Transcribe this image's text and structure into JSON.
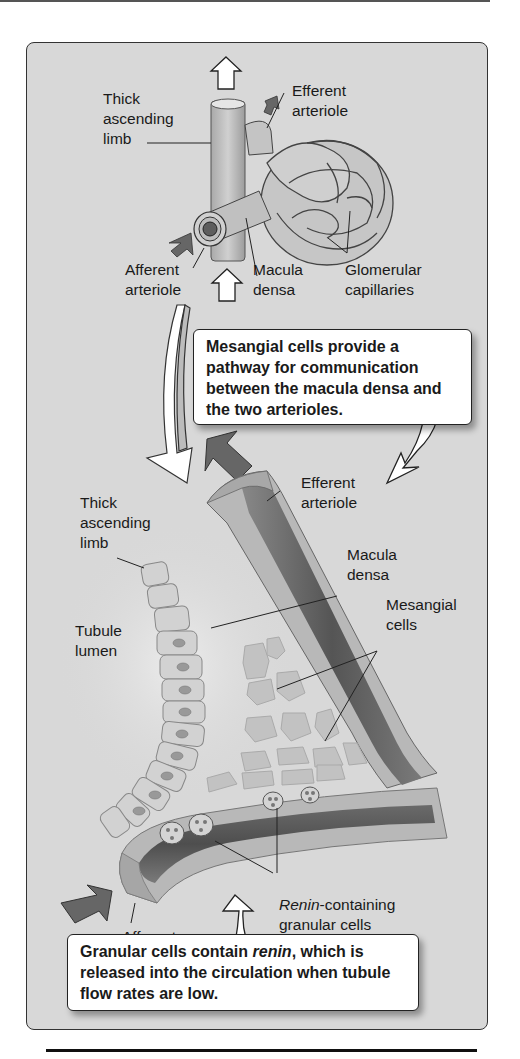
{
  "figure": {
    "colors": {
      "panel_background": "#d8d8d8",
      "vessel_outer": "#b8b8b8",
      "vessel_lumen": "#6e6e6e",
      "flow_arrow_dark": "#666666",
      "callout_background": "#ffffff"
    },
    "top_diagram": {
      "labels": {
        "thick_ascending_limb": "Thick\nascending\nlimb",
        "efferent_arteriole": "Efferent\narteriole",
        "afferent_arteriole": "Afferent\narteriole",
        "macula_densa": "Macula\ndensa",
        "glomerular_capillaries": "Glomerular\ncapillaries"
      }
    },
    "callout_mesangial": {
      "text": "Mesangial cells provide a pathway for communication between the macula densa and the two arterioles."
    },
    "detail_diagram": {
      "labels": {
        "thick_ascending_limb": "Thick\nascending\nlimb",
        "efferent_arteriole": "Efferent\narteriole",
        "macula_densa": "Macula\ndensa",
        "mesangial_cells": "Mesangial\ncells",
        "tubule_lumen": "Tubule\nlumen",
        "renin_italic": "Renin",
        "renin_rest": "-containing\ngranular cells",
        "afferent_arteriole": "Afferent\narteriole"
      }
    },
    "callout_granular": {
      "text_before": "Granular cells contain ",
      "text_italic": "renin",
      "text_after": ", which is released into the circulation when tubule flow rates are low."
    }
  }
}
